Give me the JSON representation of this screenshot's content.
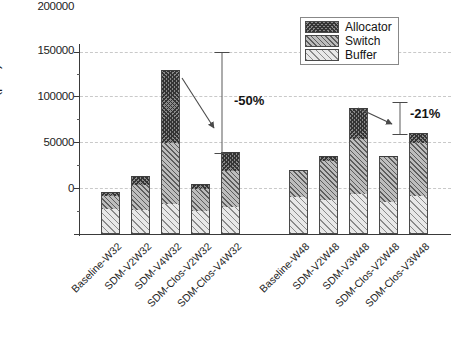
{
  "chart_data": {
    "type": "bar",
    "subtype": "stacked-bar",
    "title": "",
    "xlabel": "",
    "ylabel": "Area (μm²)",
    "ylim": [
      0,
      215000
    ],
    "yticks": [
      0,
      50000,
      100000,
      150000,
      200000
    ],
    "ytick_labels": [
      "0",
      "50000",
      "100000",
      "150000",
      "200000"
    ],
    "minor_ticks": true,
    "grid": "horizontal-dashed",
    "legend_position": "top-right",
    "categories": [
      "Baseline-W32",
      "SDM-V2W32",
      "SDM-V4W32",
      "SDM-Clos-V2W32",
      "SDM-Clos-V4W32",
      "Baseline-W48",
      "SDM-V2W48",
      "SDM-V3W48",
      "SDM-Clos-V2W48",
      "SDM-Clos-V3W48"
    ],
    "series": [
      {
        "name": "Buffer",
        "values": [
          29000,
          28000,
          34000,
          26000,
          31000,
          42000,
          39000,
          46000,
          37000,
          43000
        ]
      },
      {
        "name": "Switch",
        "values": [
          15000,
          28000,
          70000,
          25000,
          41000,
          31000,
          45000,
          63000,
          52000,
          61000
        ]
      },
      {
        "name": "Allocator",
        "values": [
          4000,
          10000,
          84000,
          6000,
          22000,
          0,
          5000,
          35000,
          0,
          11000
        ]
      }
    ],
    "totals": [
      48000,
      66000,
      188000,
      57000,
      94000,
      73000,
      89000,
      144000,
      89000,
      115000
    ],
    "annotations": [
      {
        "label": "-50%",
        "from_category": "SDM-V4W32",
        "to_category": "SDM-Clos-V4W32",
        "from_value": 188000,
        "to_value": 94000
      },
      {
        "label": "-21%",
        "from_category": "SDM-V3W48",
        "to_category": "SDM-Clos-V3W48",
        "from_value": 144000,
        "to_value": 115000
      }
    ]
  },
  "legend": {
    "items": [
      {
        "label": "Allocator",
        "swatch": "allocator-swatch"
      },
      {
        "label": "Switch",
        "swatch": "switch-swatch"
      },
      {
        "label": "Buffer",
        "swatch": "buffer-swatch"
      }
    ]
  },
  "axis": {
    "y_title_main": "Area (μm",
    "y_title_sup": "2",
    "y_title_close": ")",
    "ytick_labels": [
      "200000",
      "150000",
      "100000",
      "50000",
      "0"
    ]
  },
  "colors": {
    "axis": "#3a3a3a",
    "grid": "#c9c9c9",
    "buffer": "#e8e8e8",
    "switch": "#bdbdbd",
    "allocator": "#8a8a8a",
    "background": "#ffffff"
  }
}
